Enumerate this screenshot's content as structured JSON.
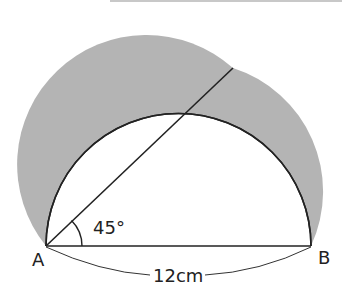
{
  "figure": {
    "points": {
      "A": {
        "label": "A",
        "x": 46,
        "y": 246
      },
      "B": {
        "label": "B",
        "x": 311,
        "y": 246
      },
      "C": {
        "x": 233,
        "y": 68
      }
    },
    "angle_label": "45°",
    "length_label": "12cm",
    "colors": {
      "shade": "#b4b4b4",
      "stroke": "#222222",
      "background": "#ffffff",
      "top_rule": "#c8c8c8"
    }
  }
}
